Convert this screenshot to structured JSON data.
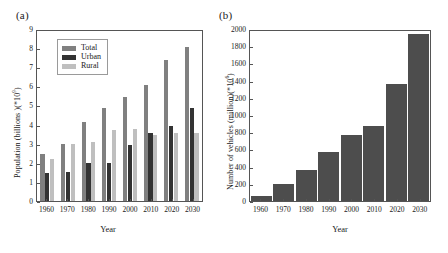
{
  "figure": {
    "panels": [
      {
        "label": "(a)",
        "legend": {
          "position": "top-left",
          "entries": [
            "Total",
            "Urban",
            "Rural"
          ]
        }
      },
      {
        "label": "(b)"
      }
    ]
  },
  "colors": {
    "total": "#808080",
    "urban": "#333333",
    "rural": "#bfbfbf",
    "vehicles": "#4d4d4d",
    "axis": "#555555",
    "text": "#1a1a1a"
  },
  "chart_data": [
    {
      "type": "bar",
      "title": "(a)",
      "categories": [
        "1960",
        "1970",
        "1980",
        "1990",
        "2000",
        "2010",
        "2020",
        "2030"
      ],
      "series": [
        {
          "name": "Total",
          "values": [
            2.5,
            3.0,
            4.2,
            4.95,
            5.5,
            6.15,
            7.45,
            8.15
          ]
        },
        {
          "name": "Urban",
          "values": [
            1.5,
            1.55,
            2.0,
            2.0,
            2.95,
            3.6,
            3.95,
            4.9
          ]
        },
        {
          "name": "Rural",
          "values": [
            2.2,
            3.0,
            3.1,
            3.75,
            3.8,
            3.5,
            3.6,
            3.6
          ]
        }
      ],
      "xlabel": "Year",
      "ylabel": "Population (billions )(*109)",
      "ylabel_base": "Population (billions )(*10",
      "ylabel_exp": "9",
      "ylabel_tail": ")",
      "ylim": [
        0,
        9
      ],
      "yticks": [
        0,
        1,
        2,
        3,
        4,
        5,
        6,
        7,
        8,
        9
      ],
      "grid": false,
      "legend": [
        "Total",
        "Urban",
        "Rural"
      ]
    },
    {
      "type": "bar",
      "title": "(b)",
      "categories": [
        "1960",
        "1970",
        "1980",
        "1990",
        "2000",
        "2010",
        "2020",
        "2030"
      ],
      "values": [
        60,
        200,
        370,
        580,
        780,
        880,
        1380,
        1970
      ],
      "series": [
        {
          "name": "Number of vehicles",
          "values": [
            60,
            200,
            370,
            580,
            780,
            880,
            1380,
            1970
          ]
        }
      ],
      "xlabel": "Year",
      "ylabel": "Number of vehicles (million)(*106)",
      "ylabel_base": "Number of vehicles (million)(*10",
      "ylabel_exp": "6",
      "ylabel_tail": ")",
      "ylim": [
        0,
        2000
      ],
      "yticks": [
        0,
        200,
        400,
        600,
        800,
        1000,
        1200,
        1400,
        1600,
        1800,
        2000
      ],
      "grid": false,
      "legend": []
    }
  ]
}
